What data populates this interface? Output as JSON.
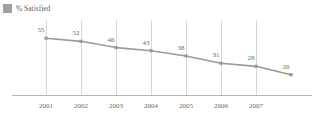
{
  "legend": {
    "swatch_color": "#a0a0a0",
    "label": "% Satisfied"
  },
  "chart_data": {
    "type": "line",
    "title": "",
    "subtitle": "",
    "xlabel": "",
    "ylabel": "",
    "categories": [
      "2001",
      "2002",
      "2003",
      "2004",
      "2005",
      "2006",
      "2007",
      ""
    ],
    "tick_labels": [
      "2001",
      "2002",
      "2003",
      "2004",
      "2005",
      "2006",
      "2007"
    ],
    "series": [
      {
        "name": "% Satisfied",
        "color": "#9a9a9a",
        "values": [
          55,
          52,
          46,
          43,
          38,
          31,
          28,
          20
        ]
      }
    ],
    "data_labels": [
      "55",
      "52",
      "46",
      "43",
      "38",
      "31",
      "28",
      "20"
    ],
    "ylim": [
      0,
      60
    ],
    "grid": "vertical",
    "grid_color": "#d8d8d8",
    "axis_color": "#b5b5b5",
    "marker": "square",
    "legend_position": "top-left"
  }
}
